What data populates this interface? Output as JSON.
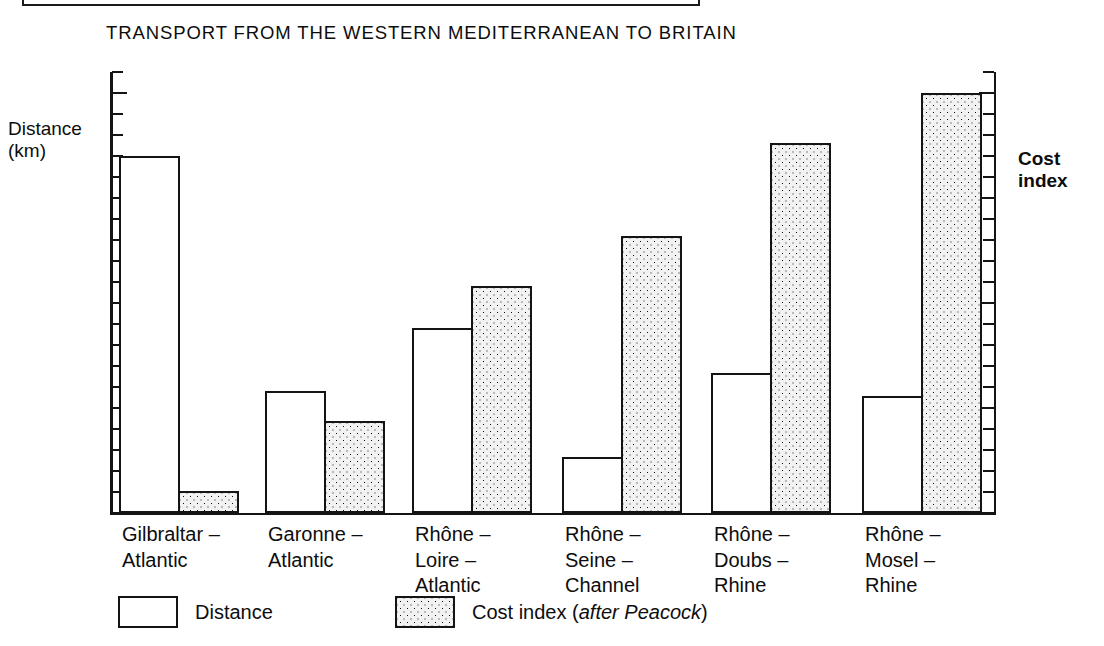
{
  "chart_data": {
    "type": "bar",
    "title": "TRANSPORT FROM THE WESTERN MEDITERRANEAN TO BRITAIN",
    "categories": [
      "Gilbraltar –\nAtlantic",
      "Garonne –\nAtlantic",
      "Rhône –\nLoire –\nAtlantic",
      "Rhône –\nSeine –\nChannel",
      "Rhône –\nDoubs –\nRhine",
      "Rhône –\nMosel –\nRhine"
    ],
    "series": [
      {
        "name": "Distance",
        "axis": "left",
        "unit": "km",
        "values": [
          2700,
          1580,
          1880,
          1265,
          1665,
          1555
        ]
      },
      {
        "name": "Cost index",
        "axis": "right",
        "unit": "index",
        "values": [
          4420,
          5760,
          8330,
          9280,
          11050,
          12000
        ]
      }
    ],
    "left_axis": {
      "label": "Distance\n(km)",
      "label_line1": "Distance",
      "label_line2": "(km)",
      "ticks": [
        1000,
        1500,
        2000,
        2500,
        3000
      ],
      "tick_labels": [
        "1000",
        "1500",
        "2000",
        "2500",
        "3000"
      ],
      "minor_tick_step": 100,
      "range": [
        1000,
        3100
      ]
    },
    "right_axis": {
      "label": "Cost\nindex",
      "label_line1": "Cost",
      "label_line2": "index",
      "ticks": [
        4000,
        6000,
        8000,
        10000,
        12000
      ],
      "tick_labels": [
        "4000",
        "6000",
        "8000",
        "10000",
        "12000"
      ],
      "minor_tick_step": 400,
      "range": [
        4000,
        12400
      ]
    },
    "legend": {
      "position": "bottom",
      "entries": [
        {
          "label": "Distance",
          "pattern": "white"
        },
        {
          "label": "Cost index (",
          "label_italic": "after Peacock",
          "label_tail": ")",
          "pattern": "dotted"
        }
      ]
    },
    "xlabel": "",
    "ylabel": "Distance (km)",
    "grid": false
  },
  "colors": {
    "ink": "#141414",
    "background": "#ffffff",
    "cost_fill": "#f2f2f2"
  }
}
